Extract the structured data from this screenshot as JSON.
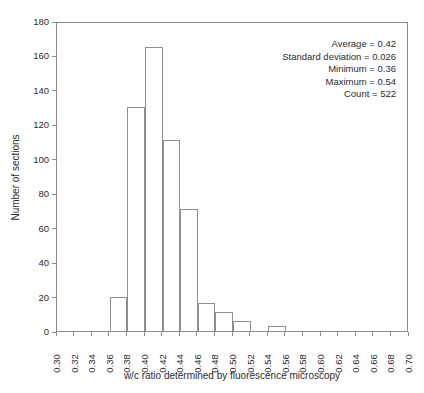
{
  "chart_data": {
    "type": "bar",
    "title": "",
    "xlabel": "w/c ratio determined by fluorescence microscopy",
    "ylabel": "Number of sections",
    "xlim": [
      0.3,
      0.7
    ],
    "ylim": [
      0,
      180
    ],
    "grid": false,
    "legend": null,
    "bin_width": 0.02,
    "x_ticks": [
      "0.30",
      "0.32",
      "0.34",
      "0.36",
      "0.38",
      "0.40",
      "0.42",
      "0.44",
      "0.46",
      "0.48",
      "0.50",
      "0.52",
      "0.54",
      "0.56",
      "0.58",
      "0.60",
      "0.62",
      "0.64",
      "0.66",
      "0.68",
      "0.70"
    ],
    "x_tick_values": [
      0.3,
      0.32,
      0.34,
      0.36,
      0.38,
      0.4,
      0.42,
      0.44,
      0.46,
      0.48,
      0.5,
      0.52,
      0.54,
      0.56,
      0.58,
      0.6,
      0.62,
      0.64,
      0.66,
      0.68,
      0.7
    ],
    "y_ticks": [
      "0",
      "20",
      "40",
      "60",
      "80",
      "100",
      "120",
      "140",
      "160",
      "180"
    ],
    "y_tick_values": [
      0,
      20,
      40,
      60,
      80,
      100,
      120,
      140,
      160,
      180
    ],
    "bins": [
      {
        "bin_start": 0.3,
        "bin_end": 0.32,
        "value": 0
      },
      {
        "bin_start": 0.32,
        "bin_end": 0.34,
        "value": 0
      },
      {
        "bin_start": 0.34,
        "bin_end": 0.36,
        "value": 0
      },
      {
        "bin_start": 0.36,
        "bin_end": 0.38,
        "value": 20
      },
      {
        "bin_start": 0.38,
        "bin_end": 0.4,
        "value": 130
      },
      {
        "bin_start": 0.4,
        "bin_end": 0.42,
        "value": 165
      },
      {
        "bin_start": 0.42,
        "bin_end": 0.44,
        "value": 111
      },
      {
        "bin_start": 0.44,
        "bin_end": 0.46,
        "value": 71
      },
      {
        "bin_start": 0.46,
        "bin_end": 0.48,
        "value": 16
      },
      {
        "bin_start": 0.48,
        "bin_end": 0.5,
        "value": 11
      },
      {
        "bin_start": 0.5,
        "bin_end": 0.52,
        "value": 6
      },
      {
        "bin_start": 0.52,
        "bin_end": 0.54,
        "value": 0
      },
      {
        "bin_start": 0.54,
        "bin_end": 0.56,
        "value": 3
      },
      {
        "bin_start": 0.56,
        "bin_end": 0.58,
        "value": 0
      },
      {
        "bin_start": 0.58,
        "bin_end": 0.6,
        "value": 0
      },
      {
        "bin_start": 0.6,
        "bin_end": 0.62,
        "value": 0
      },
      {
        "bin_start": 0.62,
        "bin_end": 0.64,
        "value": 0
      },
      {
        "bin_start": 0.64,
        "bin_end": 0.66,
        "value": 0
      },
      {
        "bin_start": 0.66,
        "bin_end": 0.68,
        "value": 0
      },
      {
        "bin_start": 0.68,
        "bin_end": 0.7,
        "value": 0
      }
    ],
    "annotations": [
      "Average = 0.42",
      "Standard deviation = 0.026",
      "Minimum = 0.36",
      "Maximum = 0.54",
      "Count = 522"
    ],
    "colors": {
      "bar_fill": "#ffffff",
      "bar_outline": "#8f8f8f",
      "axis": "#8b8b8b",
      "text": "#2b2b2b",
      "background": "#ffffff"
    }
  },
  "stats": {
    "average_label": "Average = 0.42",
    "std_label": "Standard deviation = 0.026",
    "min_label": "Minimum = 0.36",
    "max_label": "Maximum = 0.54",
    "count_label": "Count = 522"
  },
  "axes": {
    "x_title": "w/c ratio determined by fluorescence microscopy",
    "y_title": "Number of sections"
  }
}
